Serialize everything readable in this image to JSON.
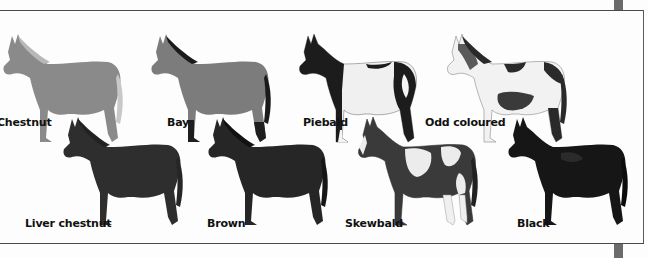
{
  "page": {
    "type": "book-illustration"
  },
  "top_row": [
    {
      "label": "Chestnut",
      "coat": "chestnut",
      "body": "#8a8a8a",
      "mane": "#b8b8b8",
      "legs": "#7a7a7a"
    },
    {
      "label": "Bay",
      "coat": "bay",
      "body": "#7c7c7c",
      "mane": "#1a1a1a",
      "legs": "#1e1e1e"
    },
    {
      "label": "Piebald",
      "coat": "piebald",
      "body": "#f0f0f0",
      "patch": "#1c1c1c",
      "legs": "#1c1c1c"
    },
    {
      "label": "Odd coloured",
      "coat": "odd-coloured",
      "body": "#f2f2f2",
      "patch": "#2a2a2a",
      "legs": "#eeeeee"
    }
  ],
  "bottom_row": [
    {
      "label": "Liver chestnut",
      "coat": "liver-chestnut",
      "body": "#2e2e2e",
      "mane": "#222222",
      "legs": "#262626"
    },
    {
      "label": "Brown",
      "coat": "brown",
      "body": "#262626",
      "mane": "#121212",
      "legs": "#161616"
    },
    {
      "label": "Skewbald",
      "coat": "skewbald",
      "body": "#3a3a3a",
      "patch": "#ececec",
      "legs": "#f0f0f0"
    },
    {
      "label": "Black",
      "coat": "black",
      "body": "#161616",
      "mane": "#0c0c0c",
      "legs": "#0e0e0e"
    }
  ]
}
